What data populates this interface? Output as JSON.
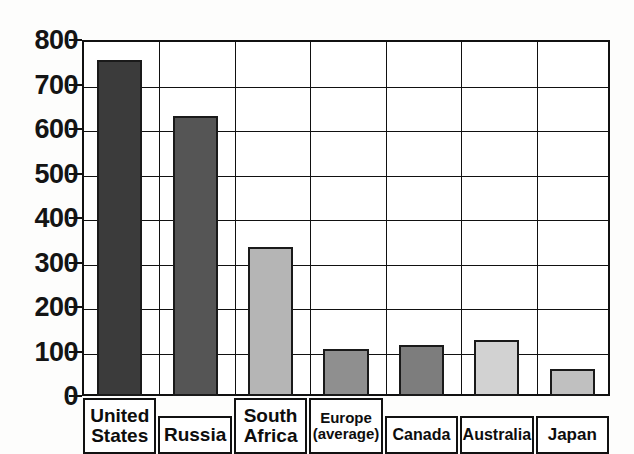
{
  "chart_data": {
    "type": "bar",
    "title": "",
    "subtitle": "",
    "xlabel": "",
    "ylabel": "",
    "ylim": [
      0,
      800
    ],
    "ytick_step": 100,
    "yticks": [
      "800",
      "700",
      "600",
      "500",
      "400",
      "300",
      "200",
      "100",
      "0"
    ],
    "grid": true,
    "legend": "none",
    "categories": [
      "United States",
      "Russia",
      "South Africa",
      "Europe (average)",
      "Canada",
      "Australia",
      "Japan"
    ],
    "values": [
      755,
      630,
      335,
      105,
      115,
      125,
      60
    ],
    "bar_colors": [
      "#3b3b3b",
      "#555555",
      "#b5b5b5",
      "#8f8f8f",
      "#7d7d7d",
      "#d2d2d2",
      "#c0c0c0"
    ]
  },
  "axis": {
    "y_labels": [
      {
        "text": "800",
        "value": 800
      },
      {
        "text": "700",
        "value": 700
      },
      {
        "text": "600",
        "value": 600
      },
      {
        "text": "500",
        "value": 500
      },
      {
        "text": "400",
        "value": 400
      },
      {
        "text": "300",
        "value": 300
      },
      {
        "text": "200",
        "value": 200
      },
      {
        "text": "100",
        "value": 100
      },
      {
        "text": "0",
        "value": 0
      }
    ]
  },
  "category_labels": [
    {
      "line1": "United",
      "line2": "States",
      "font_size": 19
    },
    {
      "line1": "Russia",
      "line2": "",
      "font_size": 19
    },
    {
      "line1": "South",
      "line2": "Africa",
      "font_size": 19
    },
    {
      "line1": "Europe",
      "line2": "(average)",
      "font_size": 15
    },
    {
      "line1": "Canada",
      "line2": "",
      "font_size": 16
    },
    {
      "line1": "Australia",
      "line2": "",
      "font_size": 16
    },
    {
      "line1": "Japan",
      "line2": "",
      "font_size": 17
    }
  ],
  "colors": {
    "axis": "#111111",
    "text": "#0d0d0d",
    "plot_background": "#ffffff",
    "page_background": "#fdfdfc"
  }
}
